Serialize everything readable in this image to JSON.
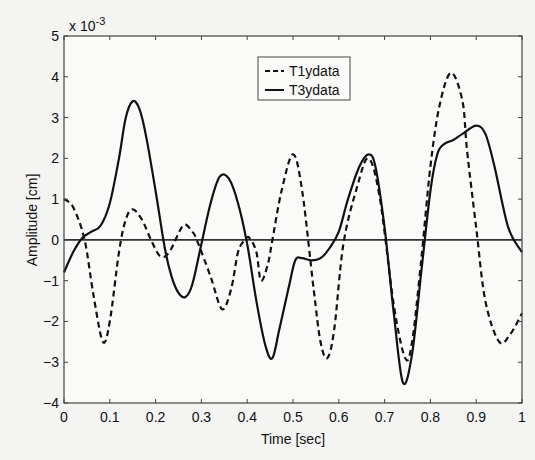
{
  "chart_data": {
    "type": "line",
    "title": "",
    "xlabel": "Time [sec]",
    "ylabel": "Amplitude [cm]",
    "y_scale_factor_label": "x 10",
    "y_scale_factor_exponent": "-3",
    "xlim": [
      0,
      1
    ],
    "ylim": [
      -4,
      5
    ],
    "x_ticks": [
      "0",
      "0.1",
      "0.2",
      "0.3",
      "0.4",
      "0.5",
      "0.6",
      "0.7",
      "0.8",
      "0.9",
      "1"
    ],
    "y_ticks": [
      "-4",
      "-3",
      "-2",
      "-1",
      "0",
      "1",
      "2",
      "3",
      "4",
      "5"
    ],
    "grid": false,
    "zero_line": true,
    "legend_position": "upper-center",
    "series": [
      {
        "name": "T1ydata",
        "style": "dashed",
        "color": "#111111",
        "x": [
          0,
          0.02,
          0.045,
          0.065,
          0.085,
          0.1,
          0.12,
          0.135,
          0.15,
          0.17,
          0.19,
          0.21,
          0.23,
          0.26,
          0.28,
          0.29,
          0.32,
          0.345,
          0.365,
          0.38,
          0.395,
          0.405,
          0.42,
          0.43,
          0.445,
          0.455,
          0.475,
          0.5,
          0.52,
          0.545,
          0.56,
          0.575,
          0.59,
          0.61,
          0.64,
          0.665,
          0.69,
          0.72,
          0.745,
          0.76,
          0.78,
          0.8,
          0.82,
          0.845,
          0.87,
          0.88,
          0.9,
          0.92,
          0.95,
          0.975,
          1.0
        ],
        "values": [
          1.0,
          0.8,
          0.0,
          -1.4,
          -2.5,
          -2.0,
          -0.3,
          0.5,
          0.75,
          0.5,
          0.0,
          -0.4,
          -0.3,
          0.35,
          0.2,
          0.0,
          -0.9,
          -1.7,
          -1.2,
          -0.3,
          0.0,
          0.05,
          -0.3,
          -1.0,
          -0.6,
          0.0,
          1.2,
          2.1,
          1.2,
          -1.2,
          -2.5,
          -2.9,
          -2.2,
          -0.1,
          1.3,
          2.0,
          1.0,
          -1.6,
          -2.9,
          -2.5,
          -0.5,
          1.8,
          3.3,
          4.1,
          3.4,
          2.2,
          0.3,
          -1.5,
          -2.5,
          -2.3,
          -1.8
        ]
      },
      {
        "name": "T3ydata",
        "style": "solid",
        "color": "#111111",
        "x": [
          0,
          0.02,
          0.04,
          0.06,
          0.08,
          0.1,
          0.12,
          0.135,
          0.15,
          0.165,
          0.18,
          0.2,
          0.22,
          0.235,
          0.25,
          0.265,
          0.28,
          0.3,
          0.32,
          0.34,
          0.36,
          0.38,
          0.4,
          0.42,
          0.44,
          0.455,
          0.47,
          0.49,
          0.505,
          0.52,
          0.54,
          0.56,
          0.58,
          0.6,
          0.62,
          0.645,
          0.665,
          0.68,
          0.7,
          0.72,
          0.74,
          0.76,
          0.78,
          0.8,
          0.815,
          0.83,
          0.85,
          0.87,
          0.9,
          0.92,
          0.94,
          0.97,
          1.0
        ],
        "values": [
          -0.8,
          -0.3,
          0.05,
          0.2,
          0.35,
          0.9,
          2.0,
          3.0,
          3.4,
          3.2,
          2.5,
          1.2,
          -0.2,
          -0.9,
          -1.3,
          -1.4,
          -1.1,
          -0.1,
          0.9,
          1.55,
          1.5,
          0.9,
          -0.1,
          -1.5,
          -2.6,
          -2.9,
          -2.2,
          -1.2,
          -0.5,
          -0.45,
          -0.5,
          -0.45,
          -0.2,
          0.2,
          1.0,
          1.8,
          2.1,
          1.8,
          0.3,
          -1.8,
          -3.5,
          -2.8,
          -0.8,
          1.2,
          2.1,
          2.35,
          2.45,
          2.6,
          2.8,
          2.6,
          1.8,
          0.3,
          -0.3
        ]
      }
    ]
  },
  "legend": {
    "items": [
      {
        "label": "T1ydata",
        "style": "dashed"
      },
      {
        "label": "T3ydata",
        "style": "solid"
      }
    ]
  }
}
